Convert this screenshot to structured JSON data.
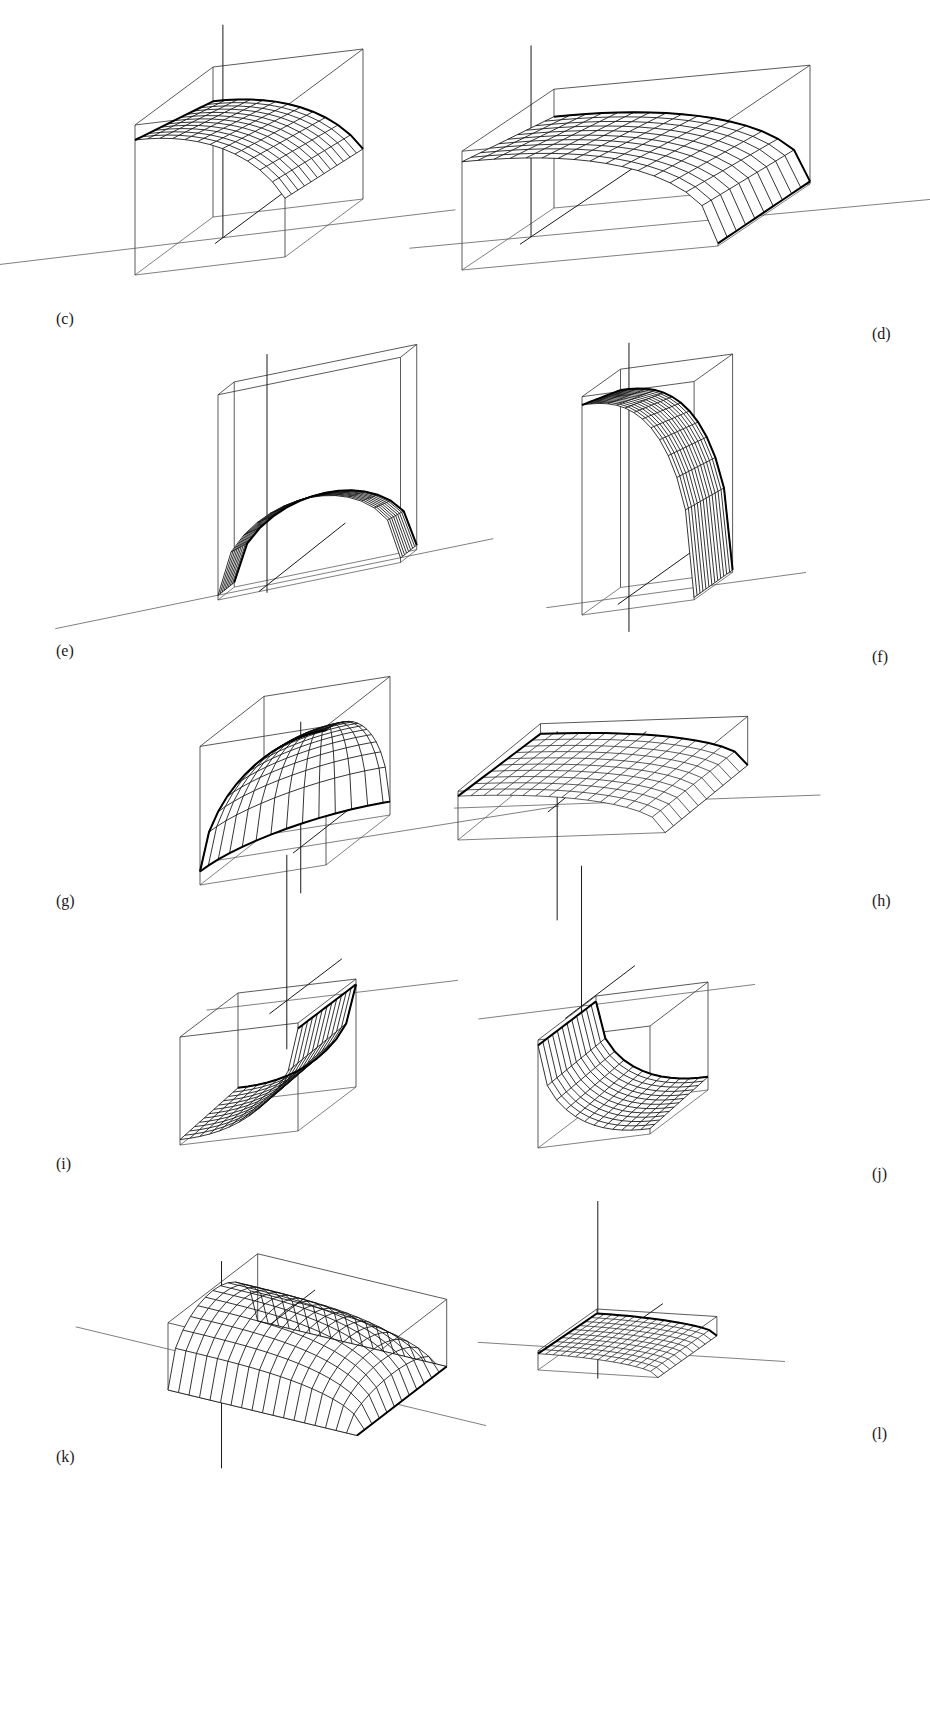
{
  "figure": {
    "kind": "multi-panel-3d-surface-figure",
    "background_color": "#ffffff",
    "line_color": "#111111",
    "box_color": "#3a3a3a",
    "page_width": 930,
    "page_height": 1718,
    "panel_count": 10,
    "columns": 2,
    "rows": 5
  },
  "panels": [
    {
      "id": "c",
      "label": "(c)",
      "label_side": "left",
      "description": "Dome-like surface filling a cube, peak near back-left, sloping down to front-right",
      "box": {
        "w": 1.0,
        "d": 1.0,
        "h": 1.0
      },
      "surface_type": "dome",
      "mesh_u": 12,
      "mesh_v": 12,
      "has_axes": true
    },
    {
      "id": "d",
      "label": "(d)",
      "label_side": "right",
      "description": "Wide shallow ridge surface in a flattened wide box, crest along the left, decaying to the right",
      "box": {
        "w": 2.0,
        "d": 1.0,
        "h": 0.85
      },
      "surface_type": "ridge",
      "mesh_u": 16,
      "mesh_v": 10,
      "has_axes": true
    },
    {
      "id": "e",
      "label": "(e)",
      "label_side": "left",
      "description": "Thin slab box viewed edge-on with an arched surface sitting in the lower half",
      "box": {
        "w": 1.2,
        "d": 0.25,
        "h": 1.3
      },
      "surface_type": "arch",
      "mesh_u": 14,
      "mesh_v": 8,
      "has_axes": true
    },
    {
      "id": "f",
      "label": "(f)",
      "label_side": "right",
      "description": "Tall upright box with a broad curved sheet spanning full height, rounded at the top",
      "box": {
        "w": 0.9,
        "d": 0.5,
        "h": 1.8
      },
      "surface_type": "tall-sheet",
      "mesh_u": 13,
      "mesh_v": 13,
      "has_axes": true
    },
    {
      "id": "g",
      "label": "(g)",
      "label_side": "left",
      "description": "Quarter-sphere / bell shaped surface nearly filling a cube, apex at top-right",
      "box": {
        "w": 1.0,
        "d": 1.0,
        "h": 1.05
      },
      "surface_type": "bell",
      "mesh_u": 14,
      "mesh_v": 14,
      "has_axes": true
    },
    {
      "id": "h",
      "label": "(h)",
      "label_side": "right",
      "description": "Very flat wide wedge in a thin flattened box, surface skimming near the bottom plane",
      "box": {
        "w": 1.8,
        "d": 1.2,
        "h": 0.35
      },
      "surface_type": "flat-wedge",
      "mesh_u": 16,
      "mesh_v": 10,
      "has_axes": true
    },
    {
      "id": "i",
      "label": "(i)",
      "label_side": "left",
      "description": "Concave bowl / paraboloid opening upward inside a cube, axes cross above the box",
      "box": {
        "w": 1.0,
        "d": 1.0,
        "h": 1.0
      },
      "surface_type": "bowl",
      "mesh_u": 12,
      "mesh_v": 12,
      "has_axes": true
    },
    {
      "id": "j",
      "label": "(j)",
      "label_side": "right",
      "description": "Concave saddle-bowl inside a cube with darkened lower-left rim, axes cross above the box",
      "box": {
        "w": 1.0,
        "d": 1.0,
        "h": 1.0
      },
      "surface_type": "bowl-tilted",
      "mesh_u": 12,
      "mesh_v": 12,
      "has_axes": true
    },
    {
      "id": "k",
      "label": "(k)",
      "label_side": "left",
      "description": "Rounded tube / half-cylinder surface lying diagonally in a flat wide box",
      "box": {
        "w": 1.7,
        "d": 1.1,
        "h": 0.55
      },
      "surface_type": "tube",
      "mesh_u": 18,
      "mesh_v": 12,
      "has_axes": true
    },
    {
      "id": "l",
      "label": "(l)",
      "label_side": "right",
      "description": "Small very flat shaded sheet in a thin flat box, seen nearly edge-on",
      "box": {
        "w": 1.2,
        "d": 0.9,
        "h": 0.18
      },
      "surface_type": "flat-sheet",
      "mesh_u": 16,
      "mesh_v": 10,
      "has_axes": true
    }
  ],
  "labels": {
    "c": "(c)",
    "d": "(d)",
    "e": "(e)",
    "f": "(f)",
    "g": "(g)",
    "h": "(h)",
    "i": "(i)",
    "j": "(j)",
    "k": "(k)",
    "l": "(l)"
  }
}
